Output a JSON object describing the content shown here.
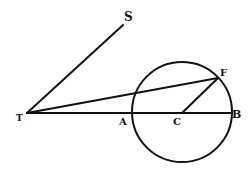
{
  "diagram": {
    "type": "geometric-figure",
    "stroke_color": "#111111",
    "background": "#ffffff",
    "points": {
      "T": {
        "label": "T",
        "x": 27,
        "y": 113
      },
      "S": {
        "label": "S",
        "x": 123,
        "y": 25
      },
      "A": {
        "label": "A",
        "x": 132,
        "y": 113
      },
      "C": {
        "label": "C",
        "x": 182,
        "y": 113
      },
      "B": {
        "label": "B",
        "x": 232,
        "y": 113
      },
      "F": {
        "label": "F",
        "x": 218,
        "y": 78
      }
    },
    "circle": {
      "center": "C",
      "cx": 182,
      "cy": 112,
      "r": 50
    },
    "segments": [
      {
        "from": "T",
        "to": "S"
      },
      {
        "from": "T",
        "to": "F"
      },
      {
        "from": "T",
        "to": "B"
      },
      {
        "from": "C",
        "to": "F"
      }
    ],
    "labels": [
      {
        "text": "T",
        "x": 16,
        "y": 121,
        "size": 9
      },
      {
        "text": "S",
        "x": 124,
        "y": 21,
        "size": 12
      },
      {
        "text": "A",
        "x": 119,
        "y": 125,
        "size": 10
      },
      {
        "text": "C",
        "x": 173,
        "y": 125,
        "size": 10
      },
      {
        "text": "B",
        "x": 232,
        "y": 118,
        "size": 11
      },
      {
        "text": "F",
        "x": 220,
        "y": 76,
        "size": 10
      }
    ]
  }
}
